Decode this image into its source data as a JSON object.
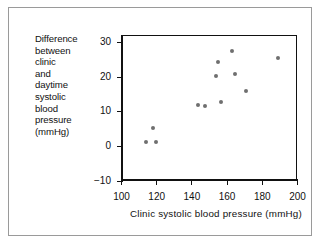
{
  "figure": {
    "border_color": "#9a9a9a",
    "axis_color": "#111111",
    "marker_color": "#6f6f6f",
    "background": "#ffffff"
  },
  "ylabel_lines": [
    "Difference",
    "between",
    "clinic",
    "and",
    "daytime",
    "systolic",
    "blood",
    "pressure",
    "(mmHg)"
  ],
  "chart_data": {
    "type": "scatter",
    "title": "",
    "xlabel": "Clinic  systolic  blood  pressure  (mmHg)",
    "ylabel": "Difference between clinic and daytime systolic blood pressure (mmHg)",
    "xlim": [
      100,
      200
    ],
    "ylim": [
      -10,
      32
    ],
    "xticks": [
      100,
      120,
      140,
      160,
      180,
      200
    ],
    "yticks": [
      -10,
      0,
      10,
      20,
      30
    ],
    "xtick_labels": [
      "100",
      "120",
      "140",
      "160",
      "180",
      "200"
    ],
    "ytick_labels": [
      "−10",
      "0",
      "10",
      "20",
      "30"
    ],
    "grid": false,
    "legend": false,
    "x": [
      114,
      118,
      120,
      144,
      148,
      154,
      155,
      157,
      163,
      165,
      171,
      189
    ],
    "y": [
      1.2,
      5.3,
      1.2,
      11.9,
      11.6,
      20.2,
      24.2,
      12.8,
      27.4,
      20.8,
      15.9,
      25.4
    ],
    "points": [
      {
        "x": 114,
        "y": 1.2
      },
      {
        "x": 118,
        "y": 5.3
      },
      {
        "x": 120,
        "y": 1.2
      },
      {
        "x": 144,
        "y": 11.9
      },
      {
        "x": 148,
        "y": 11.6
      },
      {
        "x": 154,
        "y": 20.2
      },
      {
        "x": 155,
        "y": 24.2
      },
      {
        "x": 157,
        "y": 12.8
      },
      {
        "x": 163,
        "y": 27.4
      },
      {
        "x": 165,
        "y": 20.8
      },
      {
        "x": 171,
        "y": 15.9
      },
      {
        "x": 189,
        "y": 25.4
      }
    ]
  }
}
